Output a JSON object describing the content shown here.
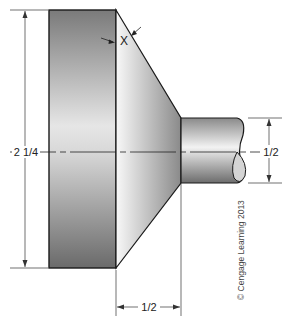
{
  "figure": {
    "type": "technical-drawing"
  },
  "dimensions": {
    "overall_diameter": "2 1/4",
    "shaft_diameter": "1/2",
    "taper_length": "1/2",
    "angle_label": "X"
  },
  "credit": "© Cengage Learning 2013",
  "colors": {
    "outline": "#1a1a1a",
    "dim_line": "#333333",
    "shade_dark": "#6e6e6e",
    "shade_light": "#f4f4f4"
  }
}
